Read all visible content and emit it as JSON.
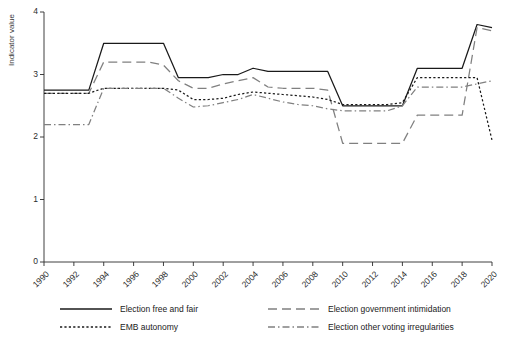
{
  "chart_data": {
    "type": "line",
    "title": "",
    "xlabel": "",
    "ylabel": "Indicator value",
    "xlim": [
      1990,
      2020
    ],
    "ylim": [
      0,
      4
    ],
    "yticks": [
      0,
      1,
      2,
      3,
      4
    ],
    "xticks": [
      1990,
      1992,
      1994,
      1996,
      1998,
      2000,
      2002,
      2004,
      2006,
      2008,
      2010,
      2012,
      2014,
      2016,
      2018,
      2020
    ],
    "x": [
      1990,
      1991,
      1992,
      1993,
      1994,
      1995,
      1996,
      1997,
      1998,
      1999,
      2000,
      2001,
      2002,
      2003,
      2004,
      2005,
      2006,
      2007,
      2008,
      2009,
      2010,
      2011,
      2012,
      2013,
      2014,
      2015,
      2016,
      2017,
      2018,
      2019,
      2020
    ],
    "grid": false,
    "legend_position": "bottom",
    "series": [
      {
        "name": "Election free and fair",
        "style": "solid",
        "color": "#1a1a1a",
        "values": [
          2.75,
          2.75,
          2.75,
          2.75,
          3.5,
          3.5,
          3.5,
          3.5,
          3.5,
          2.95,
          2.95,
          2.95,
          3.0,
          3.0,
          3.1,
          3.05,
          3.05,
          3.05,
          3.05,
          3.05,
          2.5,
          2.5,
          2.5,
          2.5,
          2.5,
          3.1,
          3.1,
          3.1,
          3.1,
          3.8,
          3.75
        ]
      },
      {
        "name": "Election government intimidation",
        "style": "dashed",
        "color": "#808080",
        "values": [
          2.7,
          2.7,
          2.7,
          2.7,
          3.2,
          3.2,
          3.2,
          3.2,
          3.15,
          2.9,
          2.78,
          2.78,
          2.85,
          2.9,
          2.95,
          2.8,
          2.78,
          2.78,
          2.78,
          2.75,
          1.9,
          1.9,
          1.9,
          1.9,
          1.9,
          2.35,
          2.35,
          2.35,
          2.35,
          3.75,
          3.7
        ]
      },
      {
        "name": "EMB autonomy",
        "style": "dotted",
        "color": "#1a1a1a",
        "values": [
          2.7,
          2.7,
          2.7,
          2.7,
          2.78,
          2.78,
          2.78,
          2.78,
          2.78,
          2.75,
          2.6,
          2.6,
          2.62,
          2.68,
          2.72,
          2.7,
          2.68,
          2.66,
          2.64,
          2.6,
          2.52,
          2.52,
          2.52,
          2.52,
          2.55,
          2.95,
          2.95,
          2.95,
          2.95,
          2.95,
          1.95
        ]
      },
      {
        "name": "Election other voting irregularities",
        "style": "dash-dot",
        "color": "#808080",
        "values": [
          2.2,
          2.2,
          2.2,
          2.2,
          2.78,
          2.78,
          2.78,
          2.78,
          2.78,
          2.62,
          2.48,
          2.5,
          2.55,
          2.6,
          2.68,
          2.62,
          2.56,
          2.52,
          2.5,
          2.45,
          2.42,
          2.42,
          2.42,
          2.42,
          2.5,
          2.8,
          2.8,
          2.8,
          2.8,
          2.85,
          2.9
        ]
      }
    ]
  },
  "legend": {
    "items": [
      {
        "label": "Election free and fair"
      },
      {
        "label": "Election government intimidation"
      },
      {
        "label": "EMB autonomy"
      },
      {
        "label": "Election other voting irregularities"
      }
    ]
  }
}
